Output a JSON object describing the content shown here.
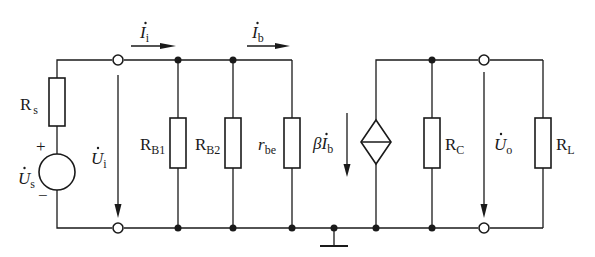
{
  "colors": {
    "line": "#1a1a1a",
    "background": "#ffffff"
  },
  "components": {
    "source_resistor": {
      "main": "R",
      "sub": "s"
    },
    "source": {
      "main": "U",
      "sub": "s",
      "plus": "+",
      "minus": "−"
    },
    "rb1": {
      "main": "R",
      "sub": "B1"
    },
    "rb2": {
      "main": "R",
      "sub": "B2"
    },
    "rbe": {
      "main": "r",
      "sub": "be"
    },
    "dependent_source": {
      "beta": "β",
      "main": "I",
      "sub": "b"
    },
    "rc": {
      "main": "R",
      "sub": "C"
    },
    "rl": {
      "main": "R",
      "sub": "L"
    }
  },
  "signals": {
    "input_voltage": {
      "main": "U",
      "sub": "i"
    },
    "input_current": {
      "main": "I",
      "sub": "i"
    },
    "base_current": {
      "main": "I",
      "sub": "b"
    },
    "output_voltage": {
      "main": "U",
      "sub": "o"
    }
  }
}
